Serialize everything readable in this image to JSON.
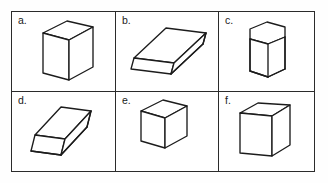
{
  "figure": {
    "background_color": "#ffffff",
    "line_color": "#1c1c1c",
    "border_color": "#2b2b2b",
    "rows": 2,
    "columns": 3
  },
  "cells": [
    {
      "label": "a.",
      "shape_name": "rectangular-prism-tall",
      "description": "Tall rectangular prism (box) standing upright, viewed from upper left"
    },
    {
      "label": "b.",
      "shape_name": "oblique-slab-parallelepiped",
      "description": "Flat oblique parallelepiped slab tilted diagonally"
    },
    {
      "label": "c.",
      "shape_name": "hexagonal-prism",
      "description": "Hexagonal prism standing upright with hexagon top face"
    },
    {
      "label": "d.",
      "shape_name": "oblique-slab-parallelepiped-thick",
      "description": "Thick flat parallelepiped slab tilted diagonally"
    },
    {
      "label": "e.",
      "shape_name": "cube",
      "description": "Cube viewed from upper left"
    },
    {
      "label": "f.",
      "shape_name": "cube-shallow-view",
      "description": "Cube viewed nearly face on with shallow top face"
    }
  ]
}
